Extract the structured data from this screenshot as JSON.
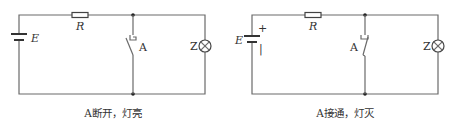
{
  "circuits": [
    {
      "id": "left",
      "battery_label": "E",
      "resistor_label": "R",
      "switch_label": "A",
      "lamp_label": "Z",
      "switch_state": "open",
      "caption": "A断开，灯亮"
    },
    {
      "id": "right",
      "battery_label": "E",
      "battery_plus": "+",
      "battery_minus": "|",
      "resistor_label": "R",
      "switch_label": "A",
      "lamp_label": "Z",
      "switch_state": "closed",
      "caption": "A接通，灯灭"
    }
  ],
  "colors": {
    "wire": "#6a6a6a",
    "text": "#333333",
    "background": "#ffffff"
  }
}
